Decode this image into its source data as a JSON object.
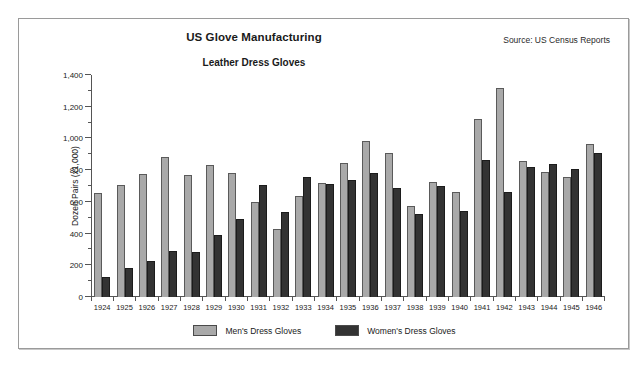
{
  "figure": {
    "title": "US Glove Manufacturing",
    "subtitle": "Leather Dress Gloves",
    "source": "Source: US Census Reports"
  },
  "chart_data": {
    "type": "bar",
    "title": "US Glove Manufacturing",
    "subtitle": "Leather Dress Gloves",
    "xlabel": "",
    "ylabel": "Dozen Pairs (x1,000)",
    "ylim": [
      0,
      1400
    ],
    "ytick_labels": [
      "1,400",
      "1,200",
      "1,000",
      "800",
      "600",
      "400",
      "200",
      "0"
    ],
    "ytick_values": [
      1400,
      1200,
      1000,
      800,
      600,
      400,
      200,
      0
    ],
    "ytick_step": 200,
    "yminor_step": 100,
    "grid": false,
    "legend_position": "bottom",
    "categories": [
      "1924",
      "1925",
      "1926",
      "1927",
      "1928",
      "1929",
      "1930",
      "1931",
      "1932",
      "1933",
      "1934",
      "1935",
      "1936",
      "1937",
      "1938",
      "1939",
      "1940",
      "1941",
      "1942",
      "1943",
      "1944",
      "1945",
      "1946"
    ],
    "series": [
      {
        "name": "Men's Dress Gloves",
        "color": "#a9a9a9",
        "values": [
          655,
          705,
          775,
          880,
          770,
          830,
          785,
          600,
          430,
          640,
          720,
          845,
          985,
          910,
          575,
          725,
          665,
          1125,
          1320,
          855,
          790,
          755,
          965
        ]
      },
      {
        "name": "Women's Dress Gloves",
        "color": "#333333",
        "values": [
          125,
          180,
          225,
          290,
          285,
          390,
          495,
          705,
          535,
          760,
          710,
          740,
          780,
          690,
          525,
          700,
          545,
          865,
          660,
          820,
          840,
          805,
          910
        ]
      }
    ]
  },
  "legend": [
    {
      "label": "Men's Dress Gloves",
      "color": "#a9a9a9"
    },
    {
      "label": "Women's Dress Gloves",
      "color": "#333333"
    }
  ]
}
